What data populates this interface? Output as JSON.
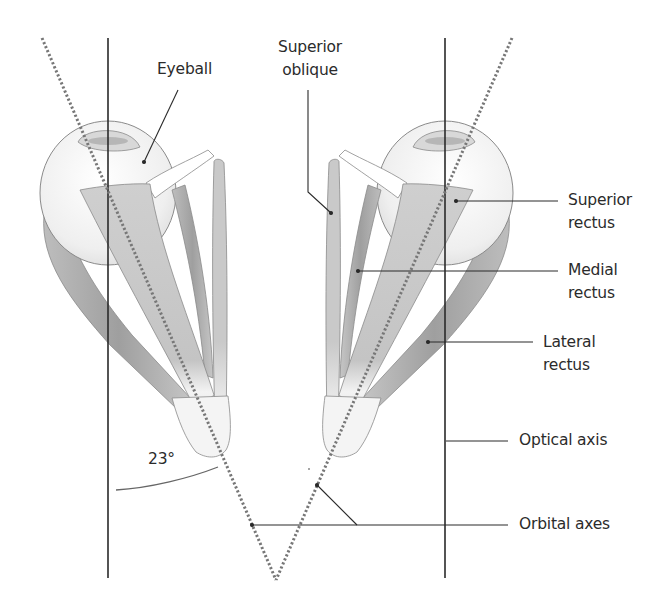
{
  "figure": {
    "angle_label": "23°",
    "labels": {
      "eyeball": [
        "Eyeball"
      ],
      "superior_oblique": [
        "Superior",
        "oblique"
      ],
      "superior_rectus": [
        "Superior",
        "rectus"
      ],
      "medial_rectus": [
        "Medial",
        "rectus"
      ],
      "lateral_rectus": [
        "Lateral",
        "rectus"
      ],
      "optical_axis": [
        "Optical axis"
      ],
      "orbital_axes": [
        "Orbital axes"
      ]
    },
    "colors": {
      "line": "#2a2a2a",
      "dotted_axis": "#777777",
      "muscle_fill": "#c8c8c8",
      "muscle_dark": "#a9a9a9",
      "eye_fill": "#f2f2f2",
      "outline": "#8a8a8a"
    }
  }
}
